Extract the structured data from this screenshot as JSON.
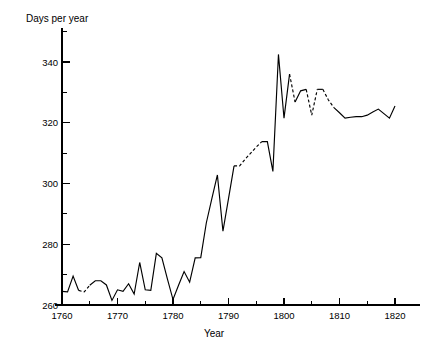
{
  "chart_data": {
    "type": "line",
    "title": "",
    "subtitle": "",
    "xlabel": "Year",
    "ylabel": "Days per year",
    "xlim": [
      1758,
      1822
    ],
    "ylim": [
      258,
      348
    ],
    "grid": false,
    "legend": null,
    "x_ticks_major": [
      1760,
      1770,
      1780,
      1790,
      1800,
      1810,
      1820
    ],
    "x_tick_labels": [
      "1760",
      "1770",
      "1780",
      "1790",
      "1800",
      "1810",
      "1820"
    ],
    "x_ticks_minor": [
      1765,
      1775,
      1785,
      1795,
      1805,
      1815
    ],
    "y_ticks_major": [
      260,
      280,
      300,
      320,
      340
    ],
    "y_tick_labels": [
      "260",
      "280",
      "300",
      "320",
      "340"
    ],
    "y_ticks_minor": [
      270,
      290,
      310,
      330
    ],
    "line_color": "#000000",
    "background_color": "#ffffff",
    "series": [
      {
        "name": "Days per year",
        "x": [
          1760,
          1761,
          1762,
          1763,
          1764,
          1765,
          1766,
          1767,
          1768,
          1769,
          1770,
          1771,
          1772,
          1773,
          1774,
          1775,
          1776,
          1777,
          1778,
          1779,
          1780,
          1781,
          1782,
          1783,
          1784,
          1785,
          1786,
          1787,
          1788,
          1789,
          1790,
          1791,
          1792,
          1793,
          1794,
          1795,
          1796,
          1797,
          1798,
          1799,
          1800,
          1801,
          1802,
          1803,
          1804,
          1805,
          1806,
          1807,
          1808,
          1809,
          1810,
          1811,
          1812,
          1813,
          1814,
          1815,
          1816,
          1817,
          1818,
          1819,
          1820
        ],
        "values": [
          264.5,
          264.3,
          269.5,
          264.8,
          264.3,
          266.5,
          268.0,
          268.0,
          266.6,
          261.5,
          265.0,
          264.5,
          267.0,
          263.6,
          274.0,
          265.0,
          264.8,
          277.0,
          275.5,
          268.5,
          261.8,
          266.5,
          271.0,
          267.5,
          275.5,
          275.6,
          287.0,
          295.0,
          302.8,
          284.3,
          295.0,
          305.8,
          305.8,
          308.0,
          310.0,
          312.0,
          313.8,
          313.8,
          304.0,
          342.5,
          321.5,
          336.0,
          326.8,
          330.5,
          331.0,
          322.5,
          331.0,
          331.0,
          327.5,
          325.0,
          323.3,
          321.5,
          321.8,
          322.0,
          322.0,
          322.5,
          323.5,
          324.5,
          323.0,
          321.5,
          325.5
        ],
        "dashed_segments": [
          [
            1763,
            1765
          ],
          [
            1791,
            1796
          ],
          [
            1801,
            1802
          ],
          [
            1804,
            1806
          ],
          [
            1807,
            1809
          ]
        ]
      }
    ]
  },
  "axes": {
    "y_label_text": "Days per year",
    "x_label_text": "Year"
  }
}
